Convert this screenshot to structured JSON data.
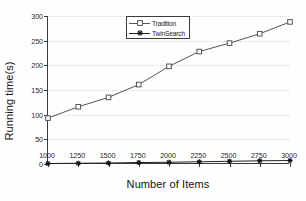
{
  "chart_data": {
    "type": "line",
    "title": "",
    "xlabel": "Number of Items",
    "ylabel": "Running time(s)",
    "x": [
      1000,
      1250,
      1500,
      1750,
      2000,
      2250,
      2500,
      2750,
      3000
    ],
    "xticklabels": [
      "1000",
      "1250",
      "1500",
      "1750",
      "2000",
      "2250",
      "2500",
      "2750",
      "3000"
    ],
    "yticks": [
      0,
      50,
      100,
      150,
      200,
      250,
      300
    ],
    "yticklabels": [
      "0",
      "50",
      "100",
      "150",
      "200",
      "250",
      "300"
    ],
    "xlim": [
      1000,
      3000
    ],
    "ylim": [
      0,
      300
    ],
    "grid": "horizontal-dotted",
    "legend_position": "upper-center",
    "series": [
      {
        "name": "Tradition",
        "marker": "square-open",
        "color": "#555555",
        "values": [
          93,
          116,
          135,
          161,
          198,
          228,
          245,
          264,
          288
        ]
      },
      {
        "name": "TwinSearch",
        "marker": "asterisk-filled",
        "color": "#222222",
        "values": [
          1,
          1.5,
          2,
          3,
          3.5,
          4.5,
          5.5,
          6.5,
          7
        ]
      }
    ]
  },
  "legend": {
    "entries": [
      {
        "label": "Tradition"
      },
      {
        "label": "TwinSearch"
      }
    ]
  }
}
